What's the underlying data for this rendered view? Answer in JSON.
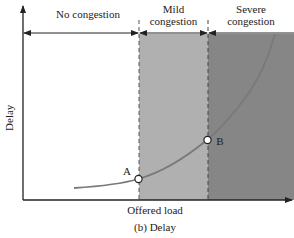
{
  "chart_data": {
    "type": "line",
    "title": "(b) Delay",
    "xlabel": "Offered load",
    "ylabel": "Delay",
    "grid": false,
    "regions": [
      {
        "name": "No congestion",
        "fill": "#ffffff",
        "x_start_px": 23,
        "x_end_px": 139
      },
      {
        "name": "Mild congestion",
        "fill": "#b0b0b0",
        "x_start_px": 139,
        "x_end_px": 208
      },
      {
        "name": "Severe congestion",
        "fill": "#868686",
        "x_start_px": 208,
        "x_end_px": 294
      }
    ],
    "curve": {
      "description": "Delay increases slowly at low load, then rises sharply (convex/exponential-like)",
      "points_px": [
        [
          74,
          188
        ],
        [
          100,
          186
        ],
        [
          120,
          183
        ],
        [
          138,
          179
        ],
        [
          160,
          172
        ],
        [
          185,
          157
        ],
        [
          207,
          140
        ],
        [
          225,
          124
        ],
        [
          240,
          108
        ],
        [
          252,
          90
        ],
        [
          262,
          70
        ],
        [
          270,
          50
        ],
        [
          275,
          34
        ]
      ],
      "color": "#7a7a7a"
    },
    "annotations": [
      {
        "label": "A",
        "x_px": 138,
        "y_px": 179,
        "note": "boundary between no congestion and mild congestion"
      },
      {
        "label": "B",
        "x_px": 207,
        "y_px": 140,
        "note": "boundary between mild and severe congestion"
      }
    ]
  },
  "labels": {
    "region_none": "No congestion",
    "region_mild": "Mild congestion",
    "region_severe": "Severe congestion",
    "ylabel": "Delay",
    "xlabel": "Offered load",
    "caption": "(b) Delay",
    "point_a": "A",
    "point_b": "B"
  },
  "colors": {
    "mild": "#b0b0b0",
    "severe": "#868686",
    "curve": "#7a7a7a",
    "axis": "#222222"
  }
}
